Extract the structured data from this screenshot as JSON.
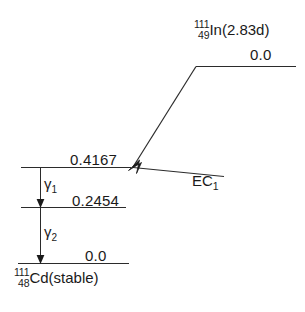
{
  "caption": "",
  "figure": {
    "type": "nuclear-decay-scheme",
    "parent": {
      "mass_number": "111",
      "atomic_number": "49",
      "symbol": "In",
      "half_life": "2.83d",
      "label": "In(2.83d)",
      "energy": "0.0"
    },
    "daughter": {
      "mass_number": "111",
      "atomic_number": "48",
      "symbol": "Cd",
      "state": "(stable)",
      "label": "Cd(stable)"
    },
    "decay_modes": [
      {
        "name": "EC",
        "index": "1",
        "label": "EC",
        "subscript": "1"
      }
    ],
    "levels": [
      {
        "id": "parent-ground",
        "energy": "0.0",
        "nuclide": "In-111"
      },
      {
        "id": "daughter-excited-2",
        "energy": "0.4167",
        "nuclide": "Cd-111"
      },
      {
        "id": "daughter-excited-1",
        "energy": "0.2454",
        "nuclide": "Cd-111"
      },
      {
        "id": "daughter-ground",
        "energy": "0.0",
        "nuclide": "Cd-111"
      }
    ],
    "gamma_transitions": [
      {
        "name": "gamma",
        "index": "1",
        "symbol": "γ",
        "subscript": "1",
        "from": "0.4167",
        "to": "0.2454"
      },
      {
        "name": "gamma",
        "index": "2",
        "symbol": "γ",
        "subscript": "2",
        "from": "0.2454",
        "to": "0.0"
      }
    ]
  },
  "colors": {
    "line": "#2b2b2b",
    "text": "#1a1a1a",
    "background": "#ffffff"
  }
}
